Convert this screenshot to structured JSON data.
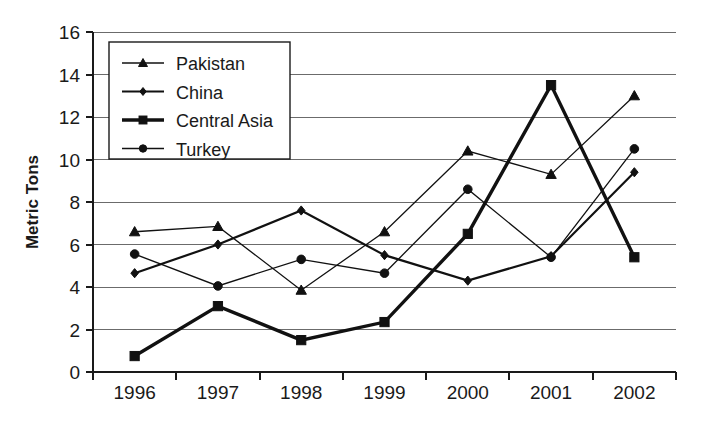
{
  "chart_data": {
    "type": "line",
    "title": "",
    "xlabel": "",
    "ylabel": "Metric Tons",
    "categories": [
      "1996",
      "1997",
      "1998",
      "1999",
      "2000",
      "2001",
      "2002"
    ],
    "ylim": [
      0,
      16
    ],
    "ytick_step": 2,
    "yticks": [
      "0",
      "2",
      "4",
      "6",
      "8",
      "10",
      "12",
      "14",
      "16"
    ],
    "grid": "horizontal",
    "legend_position": "top-left-inside",
    "series": [
      {
        "name": "Pakistan",
        "marker": "triangle",
        "line_width": 1.3,
        "values": [
          6.6,
          6.85,
          3.85,
          6.6,
          10.4,
          9.3,
          13.0
        ]
      },
      {
        "name": "China",
        "marker": "diamond",
        "line_width": 2.2,
        "values": [
          4.65,
          6.0,
          7.6,
          5.5,
          4.3,
          5.45,
          9.4
        ]
      },
      {
        "name": "Central Asia",
        "marker": "square",
        "line_width": 3.4,
        "values": [
          0.75,
          3.1,
          1.5,
          2.35,
          6.5,
          13.5,
          5.4
        ]
      },
      {
        "name": "Turkey",
        "marker": "circle",
        "line_width": 1.3,
        "values": [
          5.55,
          4.05,
          5.3,
          4.65,
          8.6,
          5.4,
          10.5
        ]
      }
    ]
  },
  "colors": {
    "ink": "#111111",
    "grid": "#6b6b6b",
    "background": "#ffffff"
  }
}
